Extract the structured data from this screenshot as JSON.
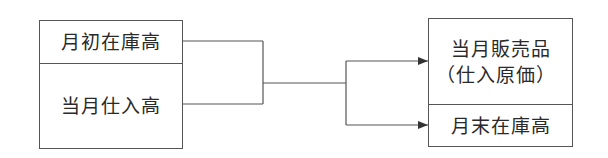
{
  "left_box": {
    "top_label": "月初在庫高",
    "bottom_label": "当月仕入高"
  },
  "right_box": {
    "top_label_line1": "当月販売品",
    "top_label_line2": "（仕入原価）",
    "bottom_label": "月末在庫高"
  },
  "colors": {
    "line": "#555555",
    "text": "#2a2a2a",
    "background": "#ffffff"
  }
}
